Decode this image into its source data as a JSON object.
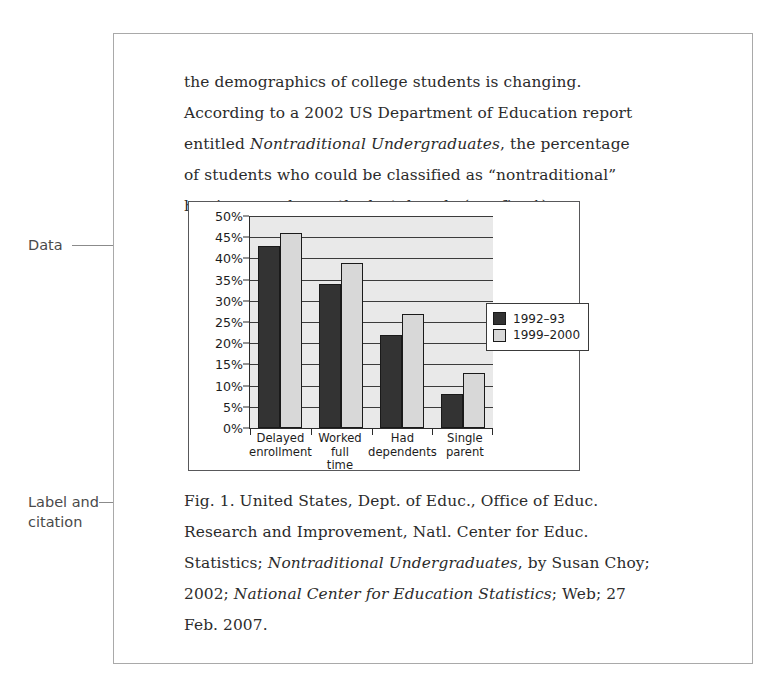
{
  "annotations": {
    "data_label": "Data",
    "label_citation": "Label and\ncitation"
  },
  "body": {
    "paragraph_parts": [
      {
        "text": "the demographics of college students is changing. According to a 2002 US Department of Education report entitled ",
        "style": "normal"
      },
      {
        "text": "Nontraditional Undergraduates",
        "style": "italic"
      },
      {
        "text": ", the percentage of students who could be classified as “nontraditional” has increased over the last decade (see fig. 1).",
        "style": "normal"
      }
    ]
  },
  "caption": {
    "parts": [
      {
        "text": "Fig. 1. United States, Dept. of Educ., Office of Educ. Research and Improvement, Natl. Center for Educ. Statistics; ",
        "style": "normal"
      },
      {
        "text": "Nontraditional Undergraduates",
        "style": "italic"
      },
      {
        "text": ", by Susan Choy; 2002; ",
        "style": "normal"
      },
      {
        "text": "National Center for Education Statistics",
        "style": "italic"
      },
      {
        "text": "; Web; 27 Feb. 2007.",
        "style": "normal"
      }
    ]
  },
  "chart_data": {
    "type": "bar",
    "title": "",
    "xlabel": "",
    "ylabel": "",
    "ylim": [
      0,
      50
    ],
    "ytick_labels": [
      "50%",
      "45%",
      "40%",
      "35%",
      "30%",
      "25%",
      "20%",
      "15%",
      "10%",
      "5%",
      "0%"
    ],
    "ytick_values": [
      50,
      45,
      40,
      35,
      30,
      25,
      20,
      15,
      10,
      5,
      0
    ],
    "grid": true,
    "legend_position": "right",
    "categories": [
      "Delayed\nenrollment",
      "Worked\nfull\ntime",
      "Had\ndependents",
      "Single\nparent"
    ],
    "series": [
      {
        "name": "1992–93",
        "color": "#333333",
        "values": [
          43,
          34,
          22,
          8
        ]
      },
      {
        "name": "1999–2000",
        "color": "#d8d8d8",
        "values": [
          46,
          39,
          27,
          13
        ]
      }
    ]
  }
}
